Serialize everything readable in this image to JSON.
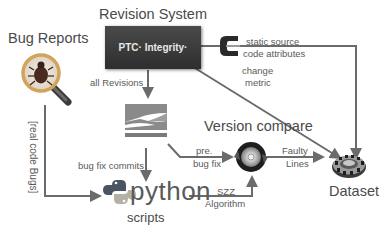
{
  "diagram": {
    "nodes": {
      "bug_reports": {
        "title": "Bug Reports",
        "icon": "magnifier-bug-icon"
      },
      "revision_system": {
        "title": "Revision System",
        "logo_text": "PTC· Integrity·",
        "icon": "ptc-integrity-logo"
      },
      "subversion": {
        "icon": "subversion-logo",
        "caption": "SUBVERSION"
      },
      "python": {
        "word": "python",
        "caption": "scripts",
        "icon": "python-logo-icon"
      },
      "version_compare": {
        "title": "Version compare",
        "icon": "compare-disc-icon"
      },
      "dataset": {
        "title": "Dataset",
        "icon": "dataset-ring-icon"
      },
      "code_attr_tool": {
        "icon": "c-bracket-icon"
      }
    },
    "edges": [
      {
        "from": "revision_system",
        "to": "subversion",
        "label": "all Revisions"
      },
      {
        "from": "revision_system",
        "to": "dataset",
        "label": "static source code attributes"
      },
      {
        "from": "revision_system",
        "to": "dataset",
        "label": "change metric"
      },
      {
        "from": "bug_reports",
        "to": "python",
        "label": "[real code Bugs]"
      },
      {
        "from": "subversion",
        "to": "python",
        "label": "bug fix commits"
      },
      {
        "from": "subversion",
        "to": "version_compare",
        "label": "pre. bug fix"
      },
      {
        "from": "python",
        "to": "version_compare",
        "label": "SZZ Algorithm"
      },
      {
        "from": "version_compare",
        "to": "dataset",
        "label": "Faulty Lines"
      }
    ],
    "labels": {
      "all_revisions": "all Revisions",
      "static_source_line1": "static source",
      "static_source_line2": "code attributes",
      "change_line1": "change",
      "change_line2": "metric",
      "real_code_bugs": "[real code Bugs]",
      "bug_fix_commits": "bug fix commits",
      "pre_line1": "pre.",
      "pre_line2": "bug fix",
      "faulty_line1": "Faulty",
      "faulty_line2": "Lines",
      "szz_line1": "SZZ",
      "szz_line2": "Algorithm"
    }
  }
}
